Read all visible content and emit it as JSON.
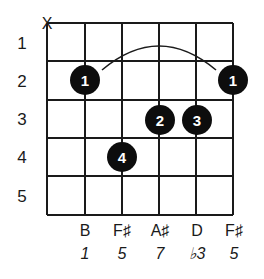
{
  "diagram": {
    "type": "guitar-chord-chart",
    "strings": 6,
    "frets_shown": 5,
    "grid": {
      "left": 47,
      "right": 233,
      "top": 23,
      "bottom": 215,
      "string_x": [
        47,
        85,
        122,
        159,
        196,
        233
      ],
      "fret_y": [
        23,
        61,
        100,
        138,
        176,
        215
      ],
      "line_color": "#1a1a1a"
    },
    "fret_numbers": [
      "1",
      "2",
      "3",
      "4",
      "5"
    ],
    "muted_strings": [
      {
        "string": 6,
        "symbol": "X"
      }
    ],
    "barre": {
      "finger": "1",
      "fret": 2,
      "from_string": 5,
      "to_string": 1,
      "style": "arc"
    },
    "fingers": [
      {
        "string": 5,
        "fret": 2,
        "finger": "1"
      },
      {
        "string": 3,
        "fret": 3,
        "finger": "2"
      },
      {
        "string": 2,
        "fret": 3,
        "finger": "3"
      },
      {
        "string": 4,
        "fret": 4,
        "finger": "4"
      },
      {
        "string": 1,
        "fret": 2,
        "finger": "1"
      }
    ],
    "notes": [
      {
        "string": 6,
        "note": "",
        "interval": ""
      },
      {
        "string": 5,
        "note": "B",
        "interval": "1"
      },
      {
        "string": 4,
        "note": "F♯",
        "interval": "5"
      },
      {
        "string": 3,
        "note": "A♯",
        "interval": "7"
      },
      {
        "string": 2,
        "note": "D",
        "interval": "♭3"
      },
      {
        "string": 1,
        "note": "F♯",
        "interval": "5"
      }
    ],
    "colors": {
      "dot_fill": "#0d0d0d",
      "dot_text": "#ffffff",
      "text": "#1a1a1a",
      "background": "#ffffff"
    }
  }
}
